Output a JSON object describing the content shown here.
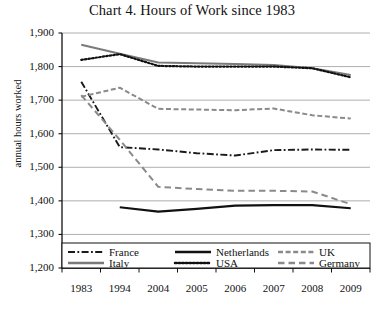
{
  "chart_data": {
    "type": "line",
    "title": "Chart 4. Hours of Work since 1983",
    "xlabel": "",
    "ylabel": "annual hours worked",
    "categories": [
      "1983",
      "1994",
      "2004",
      "2005",
      "2006",
      "2007",
      "2008",
      "2009"
    ],
    "ylim": [
      1200,
      1900
    ],
    "ytick_values": [
      1200,
      1300,
      1400,
      1500,
      1600,
      1700,
      1800,
      1900
    ],
    "ytick_labels": [
      "1,200",
      "1,300",
      "1,400",
      "1,500",
      "1,600",
      "1,700",
      "1,800",
      "1,900"
    ],
    "grid": true,
    "legend_position": "bottom-inside",
    "series": [
      {
        "name": "France",
        "style": "dash-dot",
        "color": "#1a1a1a",
        "x": [
          "1983",
          "1994",
          "2004",
          "2005",
          "2006",
          "2007",
          "2008",
          "2009"
        ],
        "values": [
          1755,
          1560,
          1553,
          1542,
          1535,
          1551,
          1553,
          1552
        ]
      },
      {
        "name": "Italy",
        "style": "solid",
        "color": "#7a7a7a",
        "x": [
          "1983",
          "1994",
          "2004",
          "2005",
          "2006",
          "2007",
          "2008",
          "2009"
        ],
        "values": [
          1865,
          1838,
          1812,
          1810,
          1808,
          1805,
          1795,
          1775
        ]
      },
      {
        "name": "Netherlands",
        "style": "solid",
        "color": "#111111",
        "x": [
          "1994",
          "2004",
          "2005",
          "2006",
          "2007",
          "2008",
          "2009"
        ],
        "values": [
          1381,
          1368,
          1376,
          1386,
          1387,
          1387,
          1378
        ]
      },
      {
        "name": "USA",
        "style": "dotted",
        "color": "#111111",
        "x": [
          "1983",
          "1994",
          "2004",
          "2005",
          "2006",
          "2007",
          "2008",
          "2009"
        ],
        "values": [
          1820,
          1837,
          1802,
          1800,
          1800,
          1800,
          1795,
          1768
        ]
      },
      {
        "name": "UK",
        "style": "dashed",
        "color": "#8a8a8a",
        "x": [
          "1983",
          "1994",
          "2004",
          "2005",
          "2006",
          "2007",
          "2008",
          "2009"
        ],
        "values": [
          1710,
          1737,
          1674,
          1672,
          1670,
          1675,
          1655,
          1645
        ]
      },
      {
        "name": "Germany",
        "style": "long-dash",
        "color": "#8a8a8a",
        "x": [
          "1983",
          "1994",
          "2004",
          "2005",
          "2006",
          "2007",
          "2008",
          "2009"
        ],
        "values": [
          1715,
          1582,
          1442,
          1435,
          1430,
          1430,
          1428,
          1390
        ]
      }
    ]
  },
  "legend": {
    "items": [
      {
        "label": "France",
        "key": "France"
      },
      {
        "label": "Netherlands",
        "key": "Netherlands"
      },
      {
        "label": "UK",
        "key": "UK"
      },
      {
        "label": "Italy",
        "key": "Italy"
      },
      {
        "label": "USA",
        "key": "USA"
      },
      {
        "label": "Germany",
        "key": "Germany"
      }
    ]
  }
}
